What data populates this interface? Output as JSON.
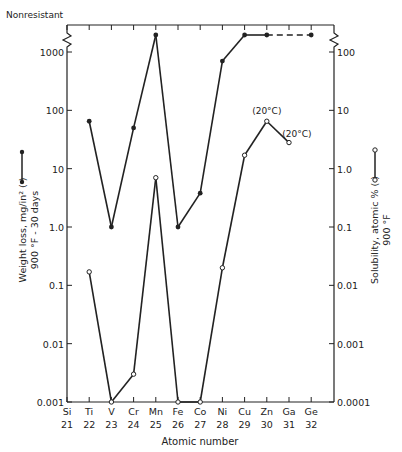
{
  "chart_data": {
    "type": "line",
    "title": "",
    "top_annotation": "Nonresistant",
    "xlabel": "Atomic number",
    "x": [
      21,
      22,
      23,
      24,
      25,
      26,
      27,
      28,
      29,
      30,
      31,
      32
    ],
    "categories": [
      "Si",
      "Ti",
      "V",
      "Cr",
      "Mn",
      "Fe",
      "Co",
      "Ni",
      "Cu",
      "Zn",
      "Ga",
      "Ge"
    ],
    "ylabel_left": "Weight loss, mg/in² (●—●) 900 °F - 30 days",
    "ylabel_right": "Solubility, atomic % (○—○) 900 °F",
    "yscale": "log",
    "ylim_left": [
      0.001,
      1000
    ],
    "ylim_right": [
      0.0001,
      100
    ],
    "yticks_left": [
      "0.001",
      "0.01",
      "0.1",
      "1.0",
      "10",
      "100",
      "1000"
    ],
    "yticks_right": [
      "0.0001",
      "0.001",
      "0.01",
      "0.1",
      "1.0",
      "10",
      "100"
    ],
    "grid": false,
    "series": [
      {
        "name": "Weight loss, mg/in² (900 °F - 30 days)",
        "axis": "left",
        "marker": "filled-circle",
        "points": [
          {
            "x": 22,
            "label": "Ti",
            "y": 65
          },
          {
            "x": 23,
            "label": "V",
            "y": 1.0
          },
          {
            "x": 24,
            "label": "Cr",
            "y": 50
          },
          {
            "x": 25,
            "label": "Mn",
            "y": "Nonresistant"
          },
          {
            "x": 26,
            "label": "Fe",
            "y": 1.0
          },
          {
            "x": 27,
            "label": "Co",
            "y": 3.8
          },
          {
            "x": 28,
            "label": "Ni",
            "y": 700
          },
          {
            "x": 29,
            "label": "Cu",
            "y": "Nonresistant"
          },
          {
            "x": 30,
            "label": "Zn",
            "y": "Nonresistant"
          },
          {
            "x": 32,
            "label": "Ge",
            "y": "Nonresistant",
            "dashed_from_previous": true
          }
        ]
      },
      {
        "name": "Solubility, atomic % (900 °F)",
        "axis": "right",
        "marker": "open-circle",
        "points": [
          {
            "x": 22,
            "label": "Ti",
            "y": 0.017
          },
          {
            "x": 23,
            "label": "V",
            "y": 0.0001
          },
          {
            "x": 24,
            "label": "Cr",
            "y": 0.0003
          },
          {
            "x": 25,
            "label": "Mn",
            "y": 0.7
          },
          {
            "x": 26,
            "label": "Fe",
            "y": 0.0001
          },
          {
            "x": 27,
            "label": "Co",
            "y": 0.0001
          },
          {
            "x": 28,
            "label": "Ni",
            "y": 0.02
          },
          {
            "x": 29,
            "label": "Cu",
            "y": 1.7
          },
          {
            "x": 30,
            "label": "Zn",
            "y": 6.5,
            "annotation": "(20°C)"
          },
          {
            "x": 31,
            "label": "Ga",
            "y": 2.8,
            "annotation": "(20°C)"
          }
        ]
      }
    ],
    "legend": "inline in axis labels (left: filled markers, right: open markers)"
  }
}
